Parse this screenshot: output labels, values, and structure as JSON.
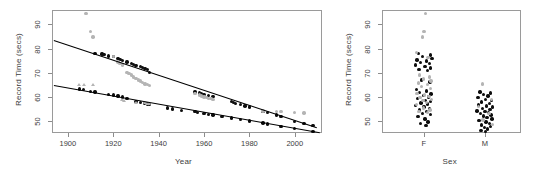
{
  "figure": {
    "panels": [
      "scatter-by-year",
      "strip-by-sex"
    ]
  },
  "chart_data": [
    {
      "id": "left-panel",
      "type": "scatter",
      "title": "",
      "xlabel": "Year",
      "ylabel": "Record Time (secs)",
      "xlim": [
        1893,
        2012
      ],
      "ylim": [
        45,
        96
      ],
      "xticks": [
        1900,
        1920,
        1940,
        1960,
        1980,
        2000
      ],
      "yticks": [
        50,
        60,
        70,
        80,
        90
      ],
      "grid": false,
      "legend": "none",
      "series": [
        {
          "name": "female-records",
          "marker": "circle",
          "color": "#0d0d0d",
          "points": [
            [
              1912,
              78.0
            ],
            [
              1915,
              77.8
            ],
            [
              1916,
              77.6
            ],
            [
              1918,
              77.0
            ],
            [
              1920,
              76.8
            ],
            [
              1922,
              76.0
            ],
            [
              1923,
              75.6
            ],
            [
              1924,
              75.0
            ],
            [
              1926,
              74.4
            ],
            [
              1928,
              73.8
            ],
            [
              1929,
              73.4
            ],
            [
              1930,
              73.0
            ],
            [
              1932,
              72.5
            ],
            [
              1933,
              72.2
            ],
            [
              1934,
              71.8
            ],
            [
              1935,
              71.4
            ],
            [
              1936,
              70.2
            ],
            [
              1956,
              62.0
            ],
            [
              1958,
              61.6
            ],
            [
              1959,
              61.2
            ],
            [
              1960,
              61.0
            ],
            [
              1962,
              60.6
            ],
            [
              1964,
              60.2
            ],
            [
              1972,
              58.0
            ],
            [
              1973,
              57.6
            ],
            [
              1974,
              57.2
            ],
            [
              1976,
              56.8
            ],
            [
              1978,
              56.2
            ],
            [
              1980,
              55.8
            ],
            [
              1986,
              54.0
            ],
            [
              1988,
              53.4
            ],
            [
              1992,
              52.4
            ],
            [
              1994,
              51.8
            ],
            [
              2000,
              49.8
            ],
            [
              2004,
              49.0
            ],
            [
              2008,
              48.2
            ]
          ]
        },
        {
          "name": "female-other",
          "marker": "circle",
          "color": "#b4b4b4",
          "points": [
            [
              1908,
              94.5
            ],
            [
              1910,
              87.0
            ],
            [
              1911,
              84.8
            ],
            [
              1920,
              76.6
            ],
            [
              1922,
              74.4
            ],
            [
              1923,
              73.8
            ],
            [
              1924,
              73.2
            ],
            [
              1926,
              70.0
            ],
            [
              1927,
              69.6
            ],
            [
              1928,
              69.0
            ],
            [
              1929,
              68.2
            ],
            [
              1930,
              67.6
            ],
            [
              1931,
              67.0
            ],
            [
              1932,
              66.6
            ],
            [
              1933,
              66.0
            ],
            [
              1934,
              65.4
            ],
            [
              1935,
              65.0
            ],
            [
              1936,
              64.6
            ],
            [
              1956,
              61.4
            ],
            [
              1958,
              60.8
            ],
            [
              1959,
              60.4
            ],
            [
              1960,
              60.0
            ],
            [
              1961,
              59.8
            ],
            [
              1962,
              59.4
            ],
            [
              1963,
              59.2
            ],
            [
              1964,
              59.0
            ],
            [
              1986,
              54.2
            ],
            [
              1992,
              54.0
            ],
            [
              1994,
              53.8
            ],
            [
              2000,
              53.4
            ],
            [
              2004,
              53.3
            ]
          ]
        },
        {
          "name": "male-records",
          "marker": "circle",
          "color": "#0d0d0d",
          "points": [
            [
              1905,
              63.2
            ],
            [
              1907,
              63.0
            ],
            [
              1910,
              62.2
            ],
            [
              1912,
              62.0
            ],
            [
              1918,
              61.0
            ],
            [
              1920,
              60.8
            ],
            [
              1922,
              60.4
            ],
            [
              1924,
              60.0
            ],
            [
              1926,
              59.4
            ],
            [
              1930,
              58.0
            ],
            [
              1932,
              57.6
            ],
            [
              1934,
              57.2
            ],
            [
              1935,
              57.0
            ],
            [
              1936,
              56.8
            ],
            [
              1944,
              55.4
            ],
            [
              1946,
              55.0
            ],
            [
              1950,
              54.4
            ],
            [
              1956,
              53.8
            ],
            [
              1957,
              53.6
            ],
            [
              1960,
              53.2
            ],
            [
              1962,
              52.8
            ],
            [
              1964,
              52.4
            ],
            [
              1968,
              51.8
            ],
            [
              1972,
              51.2
            ],
            [
              1976,
              50.6
            ],
            [
              1980,
              50.0
            ],
            [
              1986,
              49.2
            ],
            [
              1988,
              48.8
            ],
            [
              1994,
              47.8
            ],
            [
              2000,
              46.8
            ],
            [
              2008,
              45.6
            ]
          ]
        },
        {
          "name": "male-other",
          "marker": "triangle",
          "color": "#b4b4b4",
          "points": [
            [
              1905,
              64.8
            ],
            [
              1907,
              64.6
            ],
            [
              1911,
              64.6
            ],
            [
              1924,
              58.4
            ],
            [
              1925,
              58.0
            ],
            [
              1930,
              57.2
            ],
            [
              1934,
              57.0
            ],
            [
              1935,
              56.8
            ],
            [
              1936,
              56.6
            ]
          ]
        }
      ],
      "fit_lines": [
        {
          "name": "female-fit",
          "color": "#000000",
          "x": [
            1894,
            2010
          ],
          "y": [
            83.4,
            47.2
          ]
        },
        {
          "name": "male-fit",
          "color": "#000000",
          "x": [
            1894,
            2011
          ],
          "y": [
            64.9,
            45.3
          ]
        }
      ]
    },
    {
      "id": "right-panel",
      "type": "scatter",
      "title": "",
      "xlabel": "Sex",
      "ylabel": "Record Time (secs)",
      "categories": [
        "F",
        "M"
      ],
      "ylim": [
        45,
        96
      ],
      "yticks": [
        50,
        60,
        70,
        80,
        90
      ],
      "grid": false,
      "legend": "none",
      "series": [
        {
          "name": "female-strip-black",
          "color": "#0d0d0d",
          "marker": "circle",
          "values": [
            [
              -0.25,
              78.0
            ],
            [
              0.3,
              77.4
            ],
            [
              -0.05,
              76.6
            ],
            [
              0.38,
              76.0
            ],
            [
              -0.3,
              75.2
            ],
            [
              0.12,
              74.8
            ],
            [
              -0.15,
              74.2
            ],
            [
              0.26,
              73.8
            ],
            [
              -0.38,
              73.2
            ],
            [
              0.05,
              72.6
            ],
            [
              0.32,
              72.0
            ],
            [
              -0.22,
              71.4
            ],
            [
              0.18,
              70.8
            ],
            [
              -0.1,
              67.0
            ],
            [
              0.28,
              66.2
            ],
            [
              -0.34,
              63.0
            ],
            [
              0.14,
              62.4
            ],
            [
              -0.18,
              61.8
            ],
            [
              0.34,
              61.2
            ],
            [
              -0.02,
              60.6
            ],
            [
              0.22,
              60.0
            ],
            [
              -0.28,
              59.2
            ],
            [
              0.08,
              58.6
            ],
            [
              0.3,
              58.0
            ],
            [
              -0.12,
              57.4
            ],
            [
              0.18,
              57.0
            ],
            [
              -0.36,
              56.4
            ],
            [
              0.02,
              55.8
            ],
            [
              0.26,
              55.2
            ],
            [
              -0.2,
              54.6
            ],
            [
              0.12,
              54.0
            ],
            [
              -0.06,
              53.2
            ],
            [
              0.32,
              52.6
            ],
            [
              -0.26,
              51.8
            ],
            [
              0.06,
              50.8
            ],
            [
              0.2,
              49.6
            ],
            [
              -0.14,
              49.0
            ],
            [
              0.1,
              48.2
            ]
          ]
        },
        {
          "name": "female-strip-gray",
          "color": "#b4b4b4",
          "marker": "circle",
          "values": [
            [
              0.08,
              94.5
            ],
            [
              0.02,
              87.0
            ],
            [
              -0.06,
              84.8
            ],
            [
              -0.32,
              78.4
            ],
            [
              0.2,
              76.2
            ],
            [
              -0.18,
              69.0
            ],
            [
              0.26,
              68.2
            ],
            [
              -0.02,
              67.4
            ],
            [
              0.34,
              66.6
            ],
            [
              -0.24,
              65.8
            ],
            [
              0.16,
              65.0
            ],
            [
              -0.1,
              64.2
            ],
            [
              0.3,
              63.4
            ],
            [
              -0.3,
              61.4
            ],
            [
              0.04,
              60.8
            ],
            [
              0.24,
              60.2
            ],
            [
              -0.16,
              59.6
            ],
            [
              0.36,
              59.0
            ],
            [
              -0.04,
              58.4
            ],
            [
              0.14,
              57.6
            ],
            [
              -0.34,
              56.8
            ],
            [
              0.0,
              55.4
            ],
            [
              0.28,
              54.6
            ],
            [
              -0.22,
              54.0
            ],
            [
              0.18,
              53.6
            ]
          ]
        },
        {
          "name": "male-strip-black",
          "color": "#0d0d0d",
          "marker": "circle",
          "values": [
            [
              -0.22,
              62.0
            ],
            [
              0.26,
              61.6
            ],
            [
              -0.05,
              61.0
            ],
            [
              0.14,
              60.4
            ],
            [
              -0.32,
              59.6
            ],
            [
              0.04,
              59.0
            ],
            [
              0.3,
              58.4
            ],
            [
              -0.16,
              57.8
            ],
            [
              0.2,
              57.2
            ],
            [
              -0.28,
              56.6
            ],
            [
              0.08,
              56.2
            ],
            [
              0.34,
              55.8
            ],
            [
              -0.1,
              55.2
            ],
            [
              0.24,
              54.8
            ],
            [
              -0.36,
              54.2
            ],
            [
              0.0,
              53.8
            ],
            [
              0.16,
              53.4
            ],
            [
              -0.2,
              53.0
            ],
            [
              0.28,
              52.4
            ],
            [
              -0.06,
              52.0
            ],
            [
              0.1,
              51.4
            ],
            [
              0.32,
              50.8
            ],
            [
              -0.26,
              50.2
            ],
            [
              0.06,
              49.6
            ],
            [
              0.2,
              49.0
            ],
            [
              -0.14,
              48.4
            ],
            [
              0.26,
              47.8
            ],
            [
              -0.02,
              47.2
            ],
            [
              0.12,
              46.6
            ],
            [
              -0.18,
              46.0
            ],
            [
              0.04,
              45.6
            ]
          ]
        },
        {
          "name": "male-strip-gray",
          "color": "#b4b4b4",
          "marker": "circle",
          "values": [
            [
              -0.12,
              65.4
            ],
            [
              0.3,
              58.8
            ],
            [
              -0.3,
              56.0
            ],
            [
              0.18,
              53.0
            ],
            [
              -0.08,
              50.4
            ],
            [
              0.34,
              48.6
            ]
          ]
        }
      ]
    }
  ]
}
